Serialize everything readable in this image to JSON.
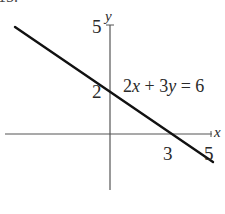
{
  "problem_number": "15.",
  "chart_data": {
    "type": "line",
    "title": "",
    "xlabel": "x",
    "ylabel": "y",
    "equation_label": "2x + 3y = 6",
    "xlim": [
      -5.2,
      5.1
    ],
    "ylim": [
      -2.8,
      5
    ],
    "grid": false,
    "x_tick_labels": [
      "3",
      "5"
    ],
    "y_tick_labels": [
      "2",
      "5"
    ],
    "series": [
      {
        "name": "2x + 3y = 6",
        "x": [
          -4.7,
          5.2
        ],
        "y": [
          5.13,
          -1.47
        ]
      }
    ],
    "intercepts": {
      "x_intercept": [
        3,
        0
      ],
      "y_intercept": [
        0,
        2
      ]
    }
  },
  "labels": {
    "x_axis": "x",
    "y_axis": "y",
    "y_tick_5": "5",
    "y_tick_2": "2",
    "x_tick_3": "3",
    "x_tick_5": "5",
    "equation": "2x + 3y = 6"
  }
}
